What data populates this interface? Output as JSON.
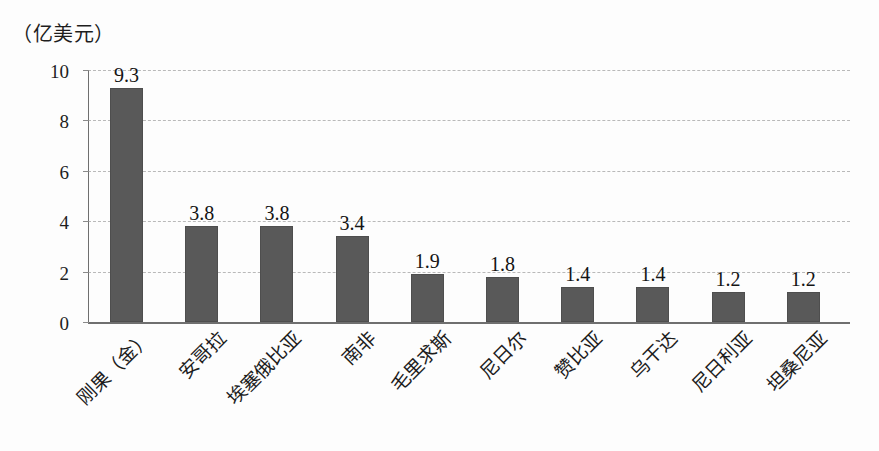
{
  "chart_data": {
    "type": "bar",
    "title": "",
    "subtitle": "",
    "unit_caption": "（亿美元）",
    "xlabel": "",
    "ylabel": "",
    "ylim": [
      0,
      10
    ],
    "yticks": [
      10,
      8,
      6,
      4,
      2,
      0
    ],
    "grid": true,
    "grid_style": "dashed-horizontal",
    "legend": "none",
    "orientation": "vertical",
    "bar_color": "#595959",
    "categories": [
      "刚果（金）",
      "安哥拉",
      "埃塞俄比亚",
      "南非",
      "毛里求斯",
      "尼日尔",
      "赞比亚",
      "乌干达",
      "尼日利亚",
      "坦桑尼亚"
    ],
    "values": [
      9.3,
      3.8,
      3.8,
      3.4,
      1.9,
      1.8,
      1.4,
      1.4,
      1.2,
      1.2
    ],
    "value_labels": [
      "9.3",
      "3.8",
      "3.8",
      "3.4",
      "1.9",
      "1.8",
      "1.4",
      "1.4",
      "1.2",
      "1.2"
    ]
  }
}
